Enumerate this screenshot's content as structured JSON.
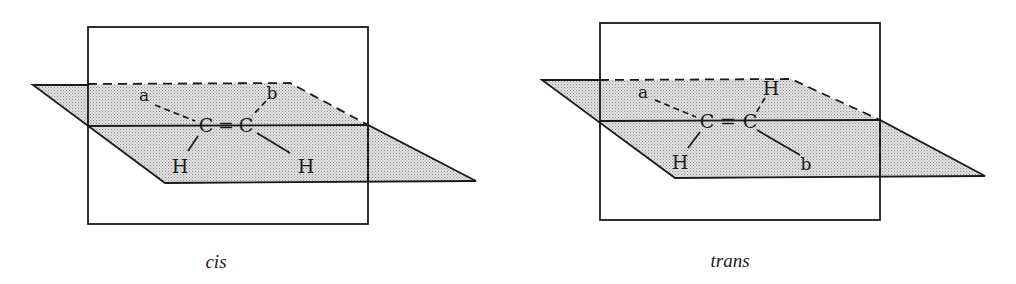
{
  "figure": {
    "colors": {
      "line": "#1a1a1a",
      "plane_fill": "#d6d6d6",
      "background": "#ffffff"
    },
    "panels": [
      {
        "id": "cis",
        "caption": "cis",
        "atoms": {
          "carbon_left": "C",
          "double_bond": "=",
          "carbon_right": "C",
          "sub_top_left": "a",
          "sub_top_right": "b",
          "sub_bottom_left": "H",
          "sub_bottom_right": "H"
        }
      },
      {
        "id": "trans",
        "caption": "trans",
        "atoms": {
          "carbon_left": "C",
          "double_bond": "=",
          "carbon_right": "C",
          "sub_top_left": "a",
          "sub_top_right": "H",
          "sub_bottom_left": "H",
          "sub_bottom_right": "b"
        }
      }
    ]
  }
}
